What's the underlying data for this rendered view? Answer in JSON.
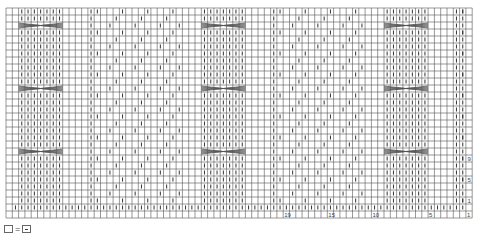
{
  "chart": {
    "title": "",
    "grid": {
      "columns": 74,
      "rows": 30,
      "left": 6,
      "top": 8,
      "cell_w": 6.3,
      "cell_h": 7.0
    },
    "colors": {
      "grid_line": "#555555",
      "purl_mark": "#333333",
      "cable": "#555555",
      "text": "#444444"
    },
    "repeat_width": 29,
    "cable_rows": [
      2,
      11,
      20
    ],
    "cable_blocks": [
      {
        "col": 2,
        "span": 7
      },
      {
        "col": 31,
        "span": 7
      },
      {
        "col": 60,
        "span": 7
      }
    ],
    "column_labels": [
      {
        "col": 44,
        "label": "19"
      },
      {
        "col": 51,
        "label": "15"
      },
      {
        "col": 58,
        "label": "10"
      },
      {
        "col": 67,
        "label": "5"
      },
      {
        "col": 73,
        "label": "1"
      }
    ],
    "row_labels": [
      {
        "row": 21,
        "label": "9"
      },
      {
        "row": 24,
        "label": "5"
      },
      {
        "row": 27,
        "label": "1"
      }
    ]
  },
  "legend": {
    "equals": "="
  }
}
